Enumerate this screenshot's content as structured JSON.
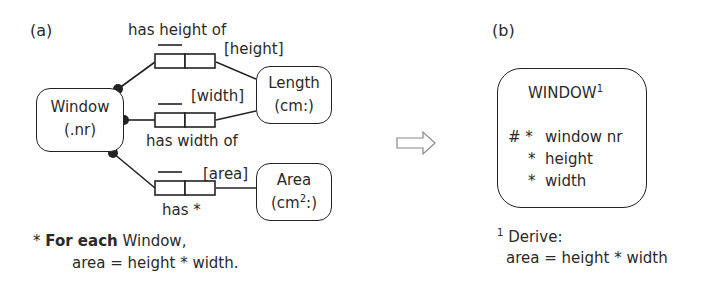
{
  "panel_a": {
    "label": "(a)",
    "entities": {
      "window": {
        "line1": "Window",
        "line2": "(.nr)"
      },
      "length": {
        "line1": "Length",
        "line2": "(cm:)"
      },
      "area": {
        "line1": "Area",
        "line2": "(cm",
        "sup": "2",
        "line2_end": ":)"
      }
    },
    "fact_types": [
      {
        "reading": "has height of",
        "role_name": "[height]"
      },
      {
        "reading": "has width of",
        "role_name": "[width]"
      },
      {
        "reading": "has *",
        "role_name": "[area]"
      }
    ],
    "footnote": {
      "marker": "*",
      "bold": "For each",
      "text": " Window,",
      "line2": "area = height * width."
    }
  },
  "arrow": {
    "icon": "right-arrow-icon"
  },
  "panel_b": {
    "label": "(b)",
    "entity": {
      "title": "WINDOW",
      "title_sup": "1",
      "attributes": [
        {
          "prefix": "# *",
          "name": "window nr"
        },
        {
          "prefix": "*",
          "name": "height"
        },
        {
          "prefix": "*",
          "name": "width"
        }
      ]
    },
    "footnote": {
      "marker": "1",
      "line1": "Derive:",
      "line2": "area = height * width"
    }
  }
}
